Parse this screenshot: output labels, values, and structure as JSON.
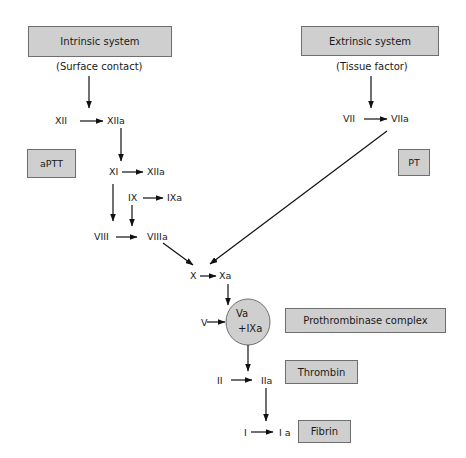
{
  "diagram": {
    "boxes": {
      "intrinsic": "Intrinsic system",
      "extrinsic": "Extrinsic system",
      "aptt": "aPTT",
      "pt": "PT",
      "prothrombinase": "Prothrombinase complex",
      "thrombin": "Thrombin",
      "fibrin": "Fibrin"
    },
    "triggers": {
      "intrinsic": "(Surface contact)",
      "extrinsic": "(Tissue factor)"
    },
    "factors": {
      "xii": "XII",
      "xiia": "XIIa",
      "xi": "XI",
      "xiia_2": "XIIa",
      "ix": "IX",
      "ixa": "IXa",
      "viii": "VIII",
      "viiia": "VIIIa",
      "vii": "VII",
      "viia": "VIIa",
      "x": "X",
      "xa": "Xa",
      "v": "V",
      "ii": "II",
      "iia": "IIa",
      "i": "I",
      "ia": "I a"
    },
    "complex_circle": {
      "line1": "Va",
      "line2": "+IXa"
    },
    "colors": {
      "box_fill": "#cfcfcf",
      "box_border": "#6e6e6e",
      "arrow": "#111111"
    }
  }
}
